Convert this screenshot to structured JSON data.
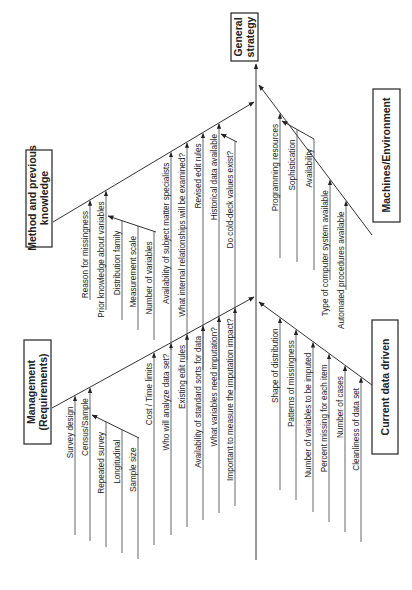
{
  "title": "General strategy",
  "categories": {
    "method": {
      "label_lines": [
        "Method and previous",
        "knowledge"
      ],
      "items": [
        "Reason for missingness",
        "Prior knowledge about variables",
        "Distribution family",
        "Measurement scale",
        "Number of variables",
        "Availability of subject matter specialists",
        "What internal relationships will be examined?",
        "Revised edit rules",
        "Historical data available",
        "Do cold-deck values exist?"
      ]
    },
    "machines": {
      "label_lines": [
        "Machines/Environment"
      ],
      "items": [
        "Programming resources",
        "Sophistication",
        "Availability",
        "Type of computer system available",
        "Automated procedures available"
      ]
    },
    "management": {
      "label_lines": [
        "Management",
        "(Requirements)"
      ],
      "items": [
        "Survey design",
        "Census/Sample",
        "Repeated survey",
        "Longitudinal",
        "Sample size",
        "Cost / Time limits",
        "Who will analyze data set?",
        "Existing edit rules",
        "Availability of standard sorts for data",
        "What variables need imputation?",
        "Important to measure the imputation impact?"
      ]
    },
    "current": {
      "label_lines": [
        "Current data driven"
      ],
      "items": [
        "Shape of distribution",
        "Patterns of missingness",
        "Number of variables to be imputed",
        "Percent missing for each item",
        "Number of cases",
        "Cleanliness of data set"
      ]
    }
  },
  "colors": {
    "line": "#333333",
    "text": "#222222",
    "background": "#ffffff"
  }
}
